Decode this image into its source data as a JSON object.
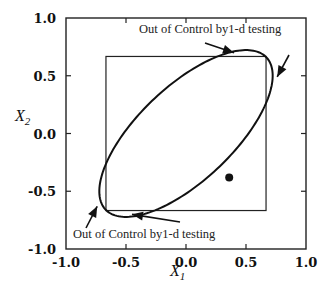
{
  "chart_data": {
    "type": "scatter",
    "title": "",
    "xlabel": "X1",
    "ylabel": "X2",
    "xlim": [
      -1.0,
      1.0
    ],
    "ylim": [
      -1.0,
      1.0
    ],
    "grid": false,
    "legend": null,
    "x_ticks": [
      "-1.0",
      "-0.5",
      "0.0",
      "0.5",
      "1.0"
    ],
    "y_ticks": [
      "1.0",
      "0.5",
      "0.0",
      "-0.5",
      "-1.0"
    ],
    "control_square": {
      "x_min": -0.667,
      "x_max": 0.667,
      "y_min": -0.667,
      "y_max": 0.667
    },
    "control_ellipse": {
      "center": [
        0,
        0
      ],
      "rotation_deg": 45,
      "semi_major": 0.94,
      "semi_minor": 0.4
    },
    "points": [
      {
        "x": 0.36,
        "y": -0.38
      }
    ],
    "annotations": [
      {
        "text": "Out of Control by1-d testing",
        "position": "top-right",
        "arrows_to": [
          [
            0.4,
            0.7
          ],
          [
            0.76,
            0.49
          ]
        ]
      },
      {
        "text": "Out of Control by1-d testing",
        "position": "bottom-left",
        "arrows_to": [
          [
            -0.74,
            -0.63
          ],
          [
            -0.45,
            -0.7
          ]
        ]
      }
    ]
  },
  "labels": {
    "xlabel_main": "X",
    "xlabel_sub": "1",
    "ylabel_main": "X",
    "ylabel_sub": "2",
    "annotation_top": "Out of Control by1-d testing",
    "annotation_bottom": "Out of Control by1-d testing"
  }
}
